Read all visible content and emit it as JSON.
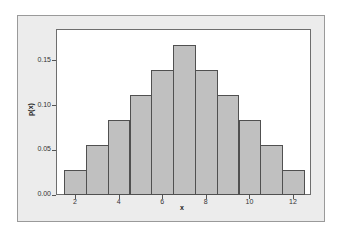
{
  "chart_data": {
    "type": "bar",
    "title": "",
    "xlabel": "x",
    "ylabel": "p(x)",
    "categories": [
      2,
      3,
      4,
      5,
      6,
      7,
      8,
      9,
      10,
      11,
      12
    ],
    "values": [
      0.0278,
      0.0556,
      0.0833,
      0.1111,
      0.1389,
      0.1667,
      0.1389,
      0.1111,
      0.0833,
      0.0556,
      0.0278
    ],
    "xticks": [
      "2",
      "4",
      "6",
      "8",
      "10",
      "12"
    ],
    "yticks": [
      "0.00",
      "0.05",
      "0.10",
      "0.15"
    ],
    "ylim": [
      0,
      0.175
    ],
    "grid": false,
    "legend": null,
    "colors": {
      "bar_fill": "#c0c0c0",
      "bar_edge": "#505050",
      "frame_bg": "#ececec",
      "plot_bg": "#ffffff"
    }
  }
}
